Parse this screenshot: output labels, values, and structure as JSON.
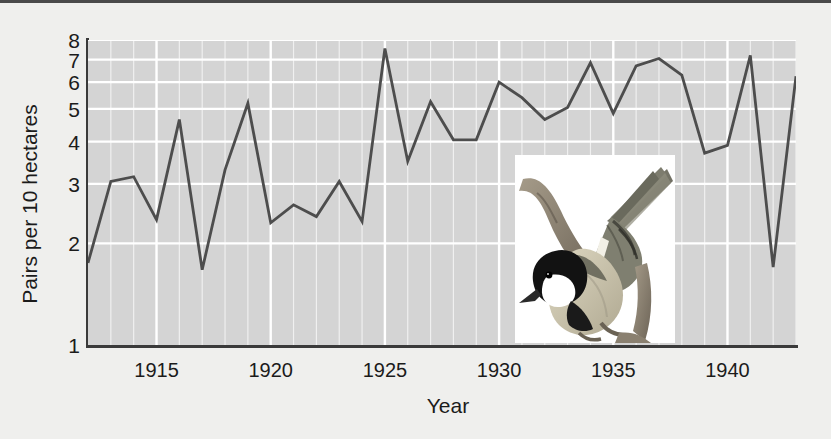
{
  "figure": {
    "background_color": "#efefed",
    "plot_background_color": "#d4d4d4",
    "gridline_color": "#ffffff",
    "line_color": "#4d4d4d",
    "axis_color": "#3a3a3a"
  },
  "chart_data": {
    "type": "line",
    "title": "",
    "xlabel": "Year",
    "ylabel": "Pairs per 10 hectares",
    "yscale": "log",
    "ylim": [
      1,
      8
    ],
    "xlim": [
      1912,
      1943
    ],
    "grid": true,
    "legend": "none",
    "yticks": [
      1,
      2,
      3,
      4,
      5,
      6,
      7,
      8
    ],
    "ytick_labels": [
      "1",
      "2",
      "3",
      "4",
      "5",
      "6",
      "7",
      "8"
    ],
    "xticks": [
      1915,
      1920,
      1925,
      1930,
      1935,
      1940
    ],
    "xtick_labels": [
      "1915",
      "1920",
      "1925",
      "1930",
      "1935",
      "1940"
    ],
    "x": [
      1912,
      1913,
      1914,
      1915,
      1916,
      1917,
      1918,
      1919,
      1920,
      1921,
      1922,
      1923,
      1924,
      1925,
      1926,
      1927,
      1928,
      1929,
      1930,
      1931,
      1932,
      1933,
      1934,
      1935,
      1936,
      1937,
      1938,
      1939,
      1940,
      1941,
      1942,
      1943
    ],
    "values": [
      1.75,
      3.05,
      3.15,
      2.35,
      4.65,
      1.67,
      3.3,
      5.2,
      2.3,
      2.6,
      2.4,
      3.05,
      2.32,
      7.55,
      3.5,
      5.25,
      4.05,
      4.05,
      6.0,
      5.4,
      4.65,
      5.05,
      6.85,
      4.85,
      6.7,
      7.05,
      6.3,
      3.7,
      3.9,
      7.2,
      1.7,
      6.25
    ],
    "series_name": "Great tit breeding pairs"
  },
  "inset": {
    "name": "great-tit-photo",
    "caption": "",
    "bird": {
      "cap_color": "#1a1a1a",
      "cheek_color": "#ffffff",
      "back_color": "#8a8a7a",
      "belly_color": "#c9c4ae",
      "branch_color": "#8f8676",
      "background_color": "#ffffff"
    }
  }
}
